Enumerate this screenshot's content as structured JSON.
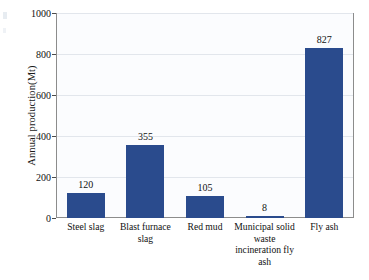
{
  "chart_data": {
    "type": "bar",
    "title": "",
    "subtitle": "",
    "xlabel": "",
    "ylabel": "Annual production(Mt)",
    "categories": [
      "Steel slag",
      "Blast furnace slag",
      "Red mud",
      "Municipal solid waste incineration fly ash",
      "Fly ash"
    ],
    "values": [
      120,
      355,
      105,
      8,
      827
    ],
    "data_labels": [
      "120",
      "355",
      "105",
      "8",
      "827"
    ],
    "ylim": [
      0,
      1000
    ],
    "ytick_labels": [
      "0",
      "200",
      "400",
      "600",
      "800",
      "1000"
    ],
    "ytick_values": [
      0,
      200,
      400,
      600,
      800,
      1000
    ],
    "grid": "horizontal",
    "legend": "none",
    "series": [
      {
        "name": "Annual production",
        "values": [
          120,
          355,
          105,
          8,
          827
        ]
      }
    ],
    "colors": {
      "bar": "#2a4b8d",
      "gridline": "#e2e6ec",
      "axis": "#8c8c8c",
      "text": "#111111",
      "plot_background": "#fbfcfe"
    }
  },
  "axis": {
    "y_title": "Annual production(Mt)"
  }
}
